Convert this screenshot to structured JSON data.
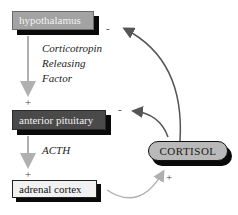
{
  "diagram": {
    "nodes": {
      "hypothalamus": "hypothalamus",
      "anterior_pituitary": "anterior pituitary",
      "adrenal_cortex": "adrenal cortex",
      "cortisol": "CORTISOL"
    },
    "edge_labels": {
      "crf_line1": "Corticotropin",
      "crf_line2": "Releasing",
      "crf_line3": "Factor",
      "acth": "ACTH"
    },
    "signs": {
      "pituitary_plus": "+",
      "adrenal_plus": "+",
      "cortisol_plus": "+",
      "hypothalamus_minus": "-",
      "pituitary_minus": "-"
    },
    "colors": {
      "hypothalamus_fill": "#a3a3a3",
      "pituitary_fill": "#4a4a4a",
      "adrenal_fill": "#f1f1f1",
      "cortisol_fill": "#b9b9b9",
      "stimulatory_arrow": "#b0b0b0",
      "inhibitory_arrow": "#555555"
    }
  }
}
